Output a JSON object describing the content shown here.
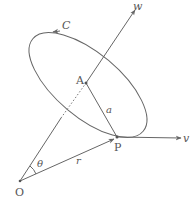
{
  "figure": {
    "type": "geometry-diagram",
    "colors": {
      "stroke": "#666666",
      "text": "#555555",
      "background": "#ffffff"
    }
  },
  "labels": {
    "curve": "C",
    "axis_w": "w",
    "axis_v": "v",
    "center": "A",
    "radius": "a",
    "point": "P",
    "origin": "O",
    "angle": "θ",
    "vector_r": "r"
  }
}
